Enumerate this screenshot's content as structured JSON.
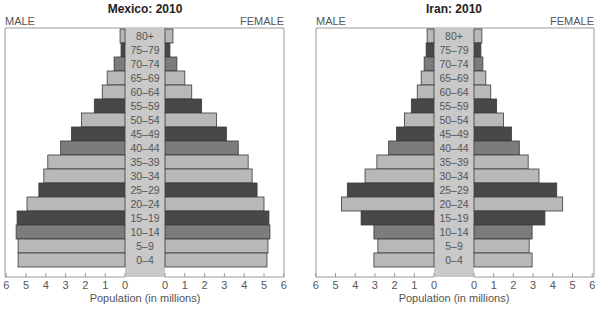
{
  "chart_data": [
    {
      "type": "bar",
      "subtype": "population-pyramid",
      "title": "Mexico: 2010",
      "left_label": "MALE",
      "right_label": "FEMALE",
      "xlabel": "Population (in millions)",
      "ylabel": "",
      "xlim": [
        0,
        6
      ],
      "xticks": [
        "6",
        "5",
        "4",
        "3",
        "2",
        "1",
        "0",
        "0",
        "1",
        "2",
        "3",
        "4",
        "5",
        "6"
      ],
      "categories": [
        "80+",
        "75–79",
        "70–74",
        "65–69",
        "60–64",
        "55–59",
        "50–54",
        "45–49",
        "40–44",
        "35–39",
        "30–34",
        "25–29",
        "20–24",
        "15–19",
        "10–14",
        "5–9",
        "0–4"
      ],
      "series": [
        {
          "name": "MALE",
          "values": [
            0.25,
            0.2,
            0.55,
            0.9,
            1.15,
            1.55,
            2.2,
            2.7,
            3.25,
            3.9,
            4.1,
            4.35,
            4.95,
            5.45,
            5.5,
            5.4,
            5.4
          ]
        },
        {
          "name": "FEMALE",
          "values": [
            0.4,
            0.25,
            0.6,
            1.0,
            1.35,
            1.85,
            2.6,
            3.1,
            3.7,
            4.2,
            4.4,
            4.65,
            5.0,
            5.25,
            5.3,
            5.2,
            5.15
          ]
        }
      ],
      "shades": [
        "light",
        "dark",
        "medium",
        "light",
        "light",
        "dark",
        "light",
        "dark",
        "medium",
        "light",
        "light",
        "dark",
        "light",
        "dark",
        "medium",
        "light",
        "light"
      ],
      "grid": false
    },
    {
      "type": "bar",
      "subtype": "population-pyramid",
      "title": "Iran: 2010",
      "left_label": "MALE",
      "right_label": "FEMALE",
      "xlabel": "Population (in millions)",
      "ylabel": "",
      "xlim": [
        0,
        6
      ],
      "xticks": [
        "6",
        "5",
        "4",
        "3",
        "2",
        "1",
        "0",
        "0",
        "1",
        "2",
        "3",
        "4",
        "5",
        "6"
      ],
      "categories": [
        "80+",
        "75–79",
        "70–74",
        "65–69",
        "60–64",
        "55–59",
        "50–54",
        "45–49",
        "40–44",
        "35–39",
        "30–34",
        "25–29",
        "20–24",
        "15–19",
        "10–14",
        "5–9",
        "0–4"
      ],
      "series": [
        {
          "name": "MALE",
          "values": [
            0.35,
            0.4,
            0.5,
            0.65,
            0.85,
            1.15,
            1.5,
            1.9,
            2.3,
            2.9,
            3.5,
            4.4,
            4.7,
            3.7,
            3.05,
            2.85,
            3.05
          ]
        },
        {
          "name": "FEMALE",
          "values": [
            0.4,
            0.35,
            0.45,
            0.6,
            0.85,
            1.15,
            1.5,
            1.9,
            2.3,
            2.75,
            3.3,
            4.2,
            4.5,
            3.6,
            2.95,
            2.8,
            2.95
          ]
        }
      ],
      "shades": [
        "light",
        "dark",
        "medium",
        "light",
        "light",
        "dark",
        "light",
        "dark",
        "medium",
        "light",
        "light",
        "dark",
        "light",
        "dark",
        "medium",
        "light",
        "light"
      ],
      "grid": false
    }
  ],
  "colors": {
    "light": "#b8b8b8",
    "medium": "#7c7c7c",
    "dark": "#484848",
    "label_column": "#c9c9c9",
    "frame": "#9a9a9a",
    "bar_stroke": "#3a3a3a"
  }
}
